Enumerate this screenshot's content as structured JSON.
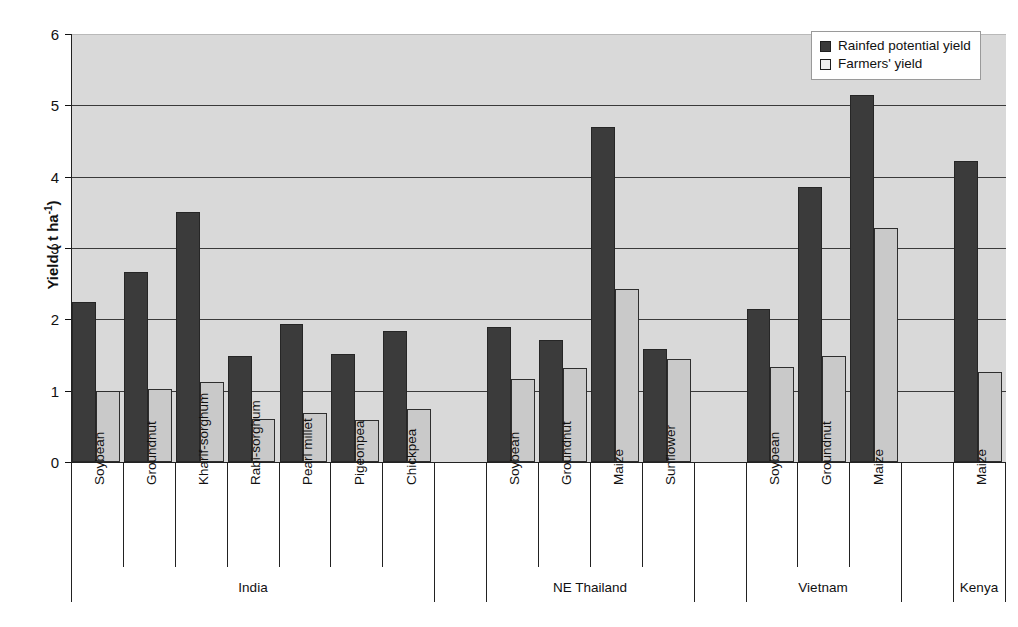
{
  "chart_data": {
    "type": "bar",
    "title": "",
    "xlabel": "",
    "ylabel": "Yield ( t ha-1)",
    "ylabel_base": "Yield ( t ha",
    "ylabel_exp": "-1",
    "ylabel_close": ")",
    "ylim": [
      0,
      6
    ],
    "ytick_labels": [
      "0",
      "1",
      "2",
      "3",
      "4",
      "5",
      "6"
    ],
    "ytick_values": [
      0,
      1,
      2,
      3,
      4,
      5,
      6
    ],
    "grid": true,
    "legend_position": "top-right",
    "series": [
      {
        "name": "Rainfed potential yield",
        "color": "#3b3b3b",
        "values": [
          2.24,
          2.67,
          3.5,
          1.49,
          1.94,
          1.51,
          1.83,
          null,
          1.89,
          1.71,
          4.7,
          1.58,
          null,
          2.15,
          3.85,
          5.15,
          null,
          4.22
        ]
      },
      {
        "name": "Farmers' yield",
        "color": "#c9c9c9",
        "values": [
          0.99,
          1.02,
          1.12,
          0.6,
          0.69,
          0.59,
          0.75,
          null,
          1.17,
          1.32,
          2.42,
          1.44,
          null,
          1.33,
          1.48,
          3.28,
          null,
          1.26
        ]
      }
    ],
    "categories": [
      "Soybean",
      "Groundnut",
      "Kharif-sorghum",
      "Rabi-sorghum",
      "Pearl millet",
      "Pigeonpea",
      "Chickpea",
      "",
      "Soybean",
      "Groundnut",
      "Maize",
      "Sunflower",
      "",
      "Soybean",
      "Groundnut",
      "Maize",
      "",
      "Maize"
    ],
    "groups": [
      {
        "label": "India",
        "start": 0,
        "end": 6
      },
      {
        "label": "NE Thailand",
        "start": 8,
        "end": 11
      },
      {
        "label": "Vietnam",
        "start": 13,
        "end": 15
      },
      {
        "label": "Kenya",
        "start": 17,
        "end": 17
      }
    ]
  },
  "legend": {
    "items": [
      {
        "label": "Rainfed potential yield",
        "style": "dark"
      },
      {
        "label": "Farmers' yield",
        "style": "light"
      }
    ]
  }
}
